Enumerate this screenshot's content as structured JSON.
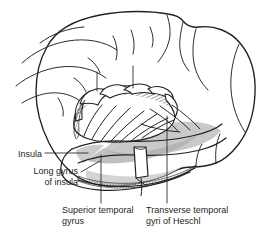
{
  "figure": {
    "kind": "anatomical-illustration",
    "background_color": "#ffffff",
    "ink_color": "#231f20",
    "shade_color": "#c6c6c6",
    "shade_color_dark": "#b0b0b0"
  },
  "labels": [
    {
      "id": "insula",
      "text": "Insula",
      "align": "right",
      "leader": "horizontal-right"
    },
    {
      "id": "long-gyrus-of-insula",
      "text": "Long gyrus\nof insula",
      "align": "right",
      "leader": "diagonal-up-right"
    },
    {
      "id": "superior-temporal-gyrus",
      "text": "Superior temporal\ngyrus",
      "align": "left",
      "leader": "vertical-up"
    },
    {
      "id": "transverse-temporal-gyri-of-heschl",
      "text": "Transverse temporal\ngyri of Heschl",
      "align": "left",
      "leader": "vertical-up"
    }
  ]
}
